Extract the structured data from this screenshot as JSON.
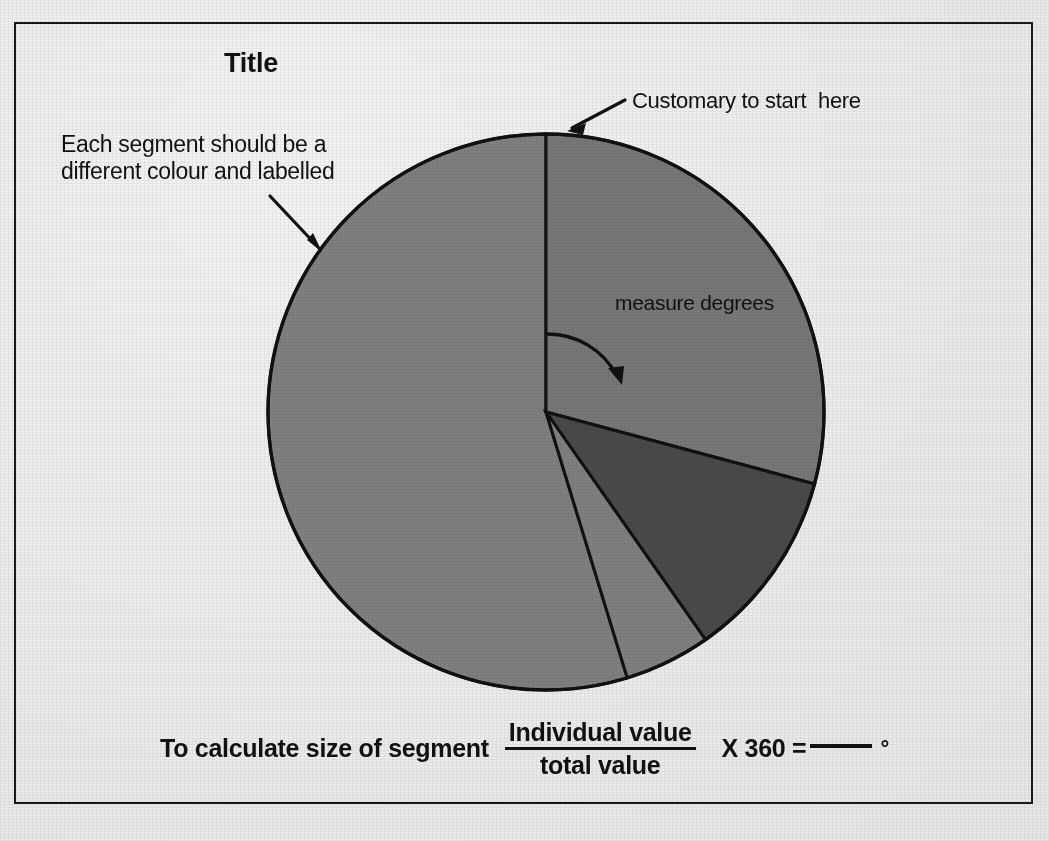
{
  "page": {
    "title": "Title",
    "background_color": "#ececeb",
    "frame_color": "#1a1a1a"
  },
  "annotations": {
    "segment_note": "Each segment should be a\ndifferent colour and labelled",
    "start_note": "Customary to start  here",
    "measure_note": "measure degrees"
  },
  "formula": {
    "lead": "To calculate size of segment",
    "numerator": "Individual  value",
    "denominator": "total value",
    "multiplier": "X 360 =",
    "blank": "",
    "degree_symbol": "°"
  },
  "chart_data": {
    "type": "pie",
    "title": "Title",
    "center": [
      546,
      412
    ],
    "radius": 278,
    "start_angle_deg": 0,
    "direction": "clockwise",
    "legend": "none",
    "grid": false,
    "labels": [
      "Segment 1",
      "Segment 2",
      "Segment 3",
      "Segment 4"
    ],
    "values": [
      29.2,
      11.1,
      5.0,
      54.7
    ],
    "angles_deg": [
      105,
      40,
      18,
      197
    ],
    "colors": [
      "#787878",
      "#4a4a4a",
      "#808080",
      "#808080"
    ],
    "slices": [
      {
        "label": "Segment 1",
        "start_deg": 0,
        "end_deg": 105,
        "value": 29.2,
        "color": "#787878"
      },
      {
        "label": "Segment 2",
        "start_deg": 105,
        "end_deg": 145,
        "value": 11.1,
        "color": "#4a4a4a"
      },
      {
        "label": "Segment 3",
        "start_deg": 145,
        "end_deg": 163,
        "value": 5.0,
        "color": "#808080"
      },
      {
        "label": "Segment 4",
        "start_deg": 163,
        "end_deg": 360,
        "value": 54.7,
        "color": "#808080"
      }
    ],
    "annotations": [
      {
        "text": "Customary to start  here",
        "points_to": "top-of-pie"
      },
      {
        "text": "Each segment should be a different colour and labelled",
        "points_to": "pie-edge-upper-left"
      },
      {
        "text": "measure degrees",
        "points_to": "first-slice-angle"
      }
    ]
  }
}
